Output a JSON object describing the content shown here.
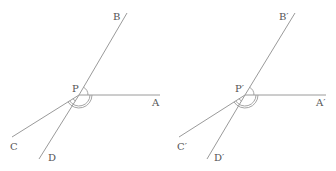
{
  "figures": [
    {
      "name": "left",
      "vertex": {
        "label": "P",
        "x": 79,
        "y": 95,
        "lx": 72,
        "ly": 92
      },
      "rays": [
        {
          "id": "A",
          "label": "A",
          "x": 160,
          "y": 95,
          "lx": 152,
          "ly": 106
        },
        {
          "id": "B",
          "label": "B",
          "x": 127,
          "y": 13,
          "lx": 113,
          "ly": 20
        },
        {
          "id": "C",
          "label": "C",
          "x": 12,
          "y": 137,
          "lx": 10,
          "ly": 150
        },
        {
          "id": "D",
          "label": "D",
          "x": 39,
          "y": 159,
          "lx": 48,
          "ly": 161
        }
      ]
    },
    {
      "name": "right",
      "vertex": {
        "label": "P′",
        "x": 245,
        "y": 95,
        "lx": 235,
        "ly": 92
      },
      "rays": [
        {
          "id": "A",
          "label": "A′",
          "x": 326,
          "y": 95,
          "lx": 316,
          "ly": 106
        },
        {
          "id": "B",
          "label": "B′",
          "x": 295,
          "y": 13,
          "lx": 279,
          "ly": 20
        },
        {
          "id": "C",
          "label": "C′",
          "x": 179,
          "y": 137,
          "lx": 177,
          "ly": 150
        },
        {
          "id": "D",
          "label": "D′",
          "x": 207,
          "y": 159,
          "lx": 214,
          "ly": 161
        }
      ]
    }
  ],
  "colors": {
    "line": "#9a9a9a",
    "text": "#555555"
  }
}
